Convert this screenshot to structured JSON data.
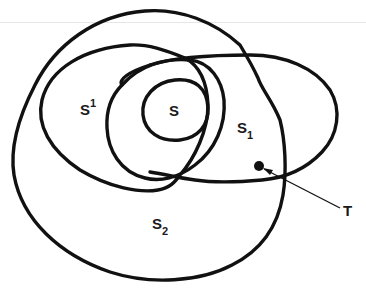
{
  "diagram": {
    "labels": {
      "s": "S",
      "s_prime_base": "S",
      "s_prime_sup": "1",
      "s1_base": "S",
      "s1_sub": "1",
      "s2_base": "S",
      "s2_sub": "2",
      "t": "T"
    },
    "regions": [
      "S",
      "S^1",
      "S_1",
      "S_2"
    ],
    "point": "T",
    "colors": {
      "stroke": "#111111",
      "background": "#ffffff"
    }
  }
}
